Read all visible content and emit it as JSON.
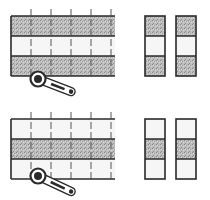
{
  "diagram": {
    "colors": {
      "background": "#ffffff",
      "line": "#2a2a2a",
      "fabric_dark": "#b8b8b8",
      "fabric_light": "#f6f6f6"
    },
    "panels": [
      {
        "id": "top",
        "strip_set": {
          "x": 11,
          "y": 16,
          "width": 104,
          "band_height": 20,
          "bands": [
            "dark",
            "light",
            "dark"
          ],
          "cut_lines_x": [
            31,
            51,
            71,
            91,
            111
          ],
          "tick_top": 9
        },
        "cutter": {
          "cx": 38,
          "cy": 79,
          "end_x": 72,
          "end_y": 92
        },
        "segments": [
          {
            "x": 145,
            "y": 16,
            "width": 20,
            "bands": [
              "dark",
              "light",
              "dark"
            ]
          },
          {
            "x": 176,
            "y": 16,
            "width": 20,
            "bands": [
              "dark",
              "light",
              "dark"
            ]
          }
        ]
      },
      {
        "id": "bottom",
        "strip_set": {
          "x": 11,
          "y": 119,
          "width": 104,
          "band_height": 20,
          "bands": [
            "light",
            "dark",
            "light"
          ],
          "cut_lines_x": [
            31,
            51,
            71,
            91,
            111
          ],
          "tick_top": 112
        },
        "cutter": {
          "cx": 38,
          "cy": 176,
          "end_x": 72,
          "end_y": 192
        },
        "segments": [
          {
            "x": 145,
            "y": 119,
            "width": 20,
            "bands": [
              "light",
              "dark",
              "light"
            ]
          },
          {
            "x": 176,
            "y": 119,
            "width": 20,
            "bands": [
              "light",
              "dark",
              "light"
            ]
          }
        ]
      }
    ]
  }
}
